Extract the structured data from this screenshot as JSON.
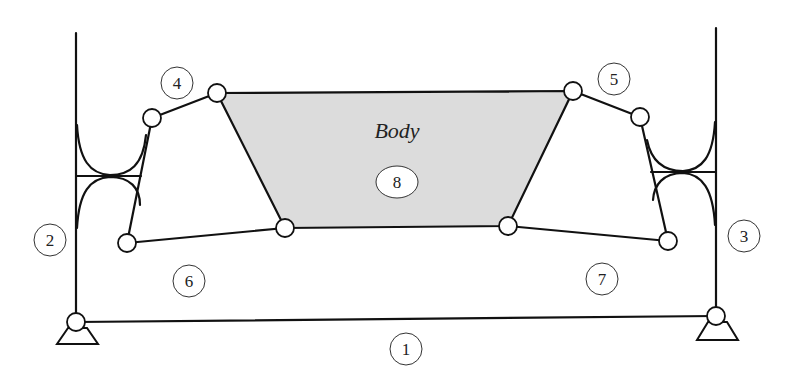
{
  "diagram": {
    "title_label": "Body",
    "colors": {
      "line": "#111111",
      "body_fill": "#dcdcdc",
      "background": "#ffffff"
    },
    "link_labels": [
      {
        "id": "1",
        "text": "1",
        "x": 406,
        "y": 349
      },
      {
        "id": "2",
        "text": "2",
        "x": 50,
        "y": 240
      },
      {
        "id": "3",
        "text": "3",
        "x": 744,
        "y": 236
      },
      {
        "id": "4",
        "text": "4",
        "x": 177,
        "y": 83
      },
      {
        "id": "5",
        "text": "5",
        "x": 614,
        "y": 79
      },
      {
        "id": "6",
        "text": "6",
        "x": 189,
        "y": 281
      },
      {
        "id": "7",
        "text": "7",
        "x": 602,
        "y": 279
      },
      {
        "id": "8",
        "text": "8",
        "x": 397,
        "y": 182
      }
    ],
    "body_label": {
      "text": "Body",
      "x": 397,
      "y": 130
    }
  }
}
